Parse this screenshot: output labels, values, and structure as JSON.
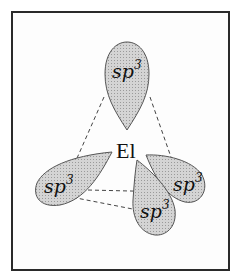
{
  "diagram": {
    "title": "",
    "center_atom": "El",
    "orbital_label": "sp",
    "orbital_superscript": "3",
    "orbitals": [
      {
        "id": "top",
        "label": "sp",
        "sup": "3"
      },
      {
        "id": "left",
        "label": "sp",
        "sup": "3"
      },
      {
        "id": "right",
        "label": "sp",
        "sup": "3"
      },
      {
        "id": "front",
        "label": "sp",
        "sup": "3"
      }
    ],
    "colors": {
      "lobe_fill": "#c8c8c8",
      "lobe_stroke": "#555555",
      "frame": "#2a2a2a",
      "dashes": "#444444"
    },
    "geometry": "tetrahedral"
  }
}
